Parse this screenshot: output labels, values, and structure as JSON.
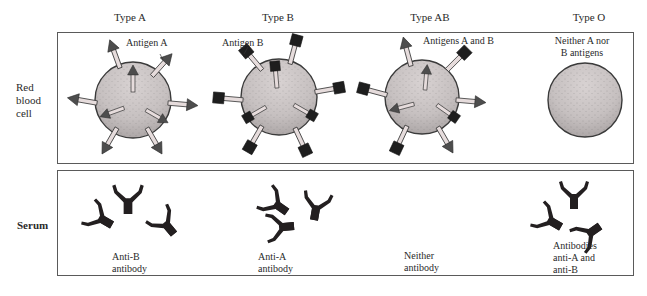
{
  "columns": [
    {
      "id": "type-a",
      "heading": "Type A"
    },
    {
      "id": "type-b",
      "heading": "Type B"
    },
    {
      "id": "type-ab",
      "heading": "Type AB"
    },
    {
      "id": "type-o",
      "heading": "Type O"
    }
  ],
  "rows": {
    "red_blood_cell": {
      "label_lines": [
        "Red",
        "blood",
        "cell"
      ]
    },
    "serum": {
      "label": "Serum"
    }
  },
  "cell_labels": {
    "type_a": "Antigen A",
    "type_b": "Antigen B",
    "type_ab": "Antigens A and B",
    "type_o_line1": "Neither A nor",
    "type_o_line2": "B antigens"
  },
  "serum_labels": {
    "type_a_line1": "Anti-B",
    "type_a_line2": "antibody",
    "type_b_line1": "Anti-A",
    "type_b_line2": "antibody",
    "type_ab_line1": "Neither",
    "type_ab_line2": "antibody",
    "type_o_line1": "Antibodies",
    "type_o_line2": "anti-A and",
    "type_o_line3": "anti-B"
  },
  "colors": {
    "cell_fill": "#c9c3c3",
    "cell_stroke": "#3a3a3a",
    "antigen_a_head": "#4d4d4d",
    "antigen_stem": "#e6dcdc",
    "antigen_b_head": "#1e1e1e",
    "antibody": "#231f20",
    "border": "#5a5a5a"
  }
}
